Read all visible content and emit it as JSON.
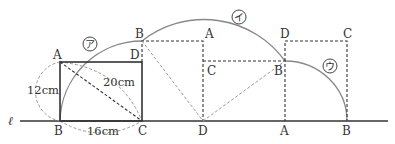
{
  "diagram": {
    "line_label": "ℓ",
    "lengths": {
      "ab": "12cm",
      "bc": "16cm",
      "ac": "20cm"
    },
    "arc_labels": [
      "ア",
      "イ",
      "ウ"
    ],
    "position1": {
      "A": "A",
      "B": "B",
      "C": "C",
      "D": "D"
    },
    "position2": {
      "B": "B",
      "A": "A",
      "D": "D"
    },
    "position3": {
      "C": "C",
      "B": "B",
      "A": "A"
    },
    "position4": {
      "D": "D",
      "C": "C",
      "B": "B"
    }
  }
}
